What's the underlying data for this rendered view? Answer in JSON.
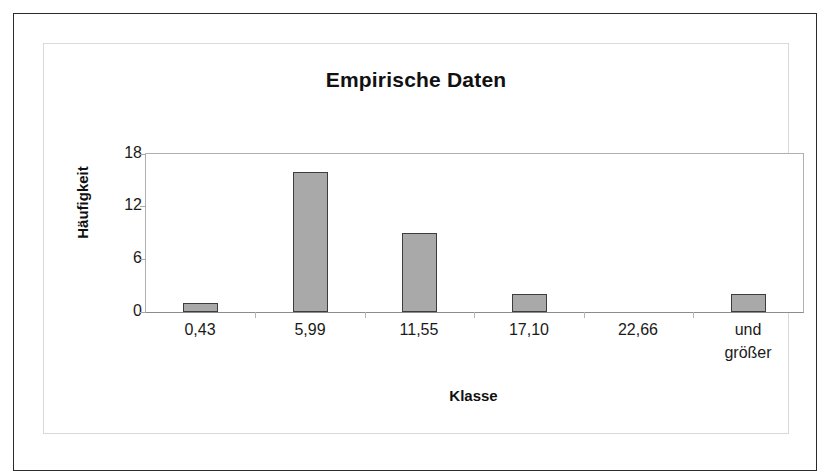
{
  "chart_data": {
    "type": "bar",
    "title": "Empirische Daten",
    "xlabel": "Klasse",
    "ylabel": "Häufigkeit",
    "categories": [
      "0,43",
      "5,99",
      "11,55",
      "17,10",
      "22,66",
      "und\ngrößer"
    ],
    "values": [
      1,
      16,
      9,
      2,
      0,
      2
    ],
    "ylim": [
      0,
      18
    ],
    "yticks": [
      0,
      6,
      12,
      18
    ],
    "ytick_labels": [
      "0",
      "6",
      "12",
      "18"
    ],
    "grid": false,
    "legend": "none",
    "bar_fill_color": "#a9a9a9",
    "bar_border_color": "#3d3d3d",
    "plot_border_color": "#b0b0b0",
    "frame_color": "#2b2b2b"
  },
  "category_label_lines": [
    [
      "0,43"
    ],
    [
      "5,99"
    ],
    [
      "11,55"
    ],
    [
      "17,10"
    ],
    [
      "22,66"
    ],
    [
      "und",
      "größer"
    ]
  ]
}
